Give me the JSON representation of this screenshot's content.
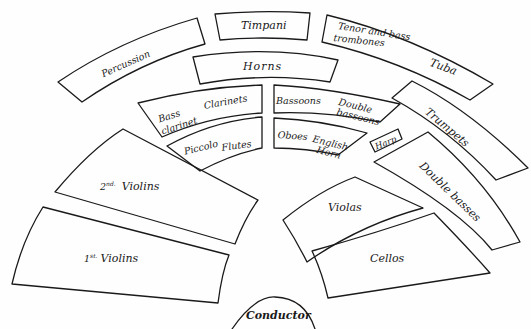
{
  "diagram": {
    "sections": {
      "percussion": "Percussion",
      "timpani": "Timpani",
      "trombones": "Tenor and bass",
      "trombones_line2": "trombones",
      "tuba": "Tuba",
      "horns": "Horns",
      "bass_clarinet": "Bass",
      "bass_clarinet_line2": "clarinet",
      "clarinets": "Clarinets",
      "bassoons": "Bassoons",
      "double_bassoons": "Double",
      "double_bassoons_line2": "bassoons",
      "trumpets": "Trumpets",
      "piccolo": "Piccolo",
      "flutes": "Flutes",
      "oboes": "Oboes",
      "english_horn": "English",
      "english_horn_line2": "Horn",
      "harp": "Harp",
      "double_basses": "Double basses",
      "second_violins_ord": "2",
      "second_violins_sup": "nd.",
      "second_violins": "Violins",
      "first_violins_ord": "1",
      "first_violins_sup": "st.",
      "first_violins": "Violins",
      "violas": "Violas",
      "cellos": "Cellos",
      "conductor": "Conductor"
    },
    "colors": {
      "ink": "#1a1a1a",
      "paper": "#fefefe"
    }
  }
}
